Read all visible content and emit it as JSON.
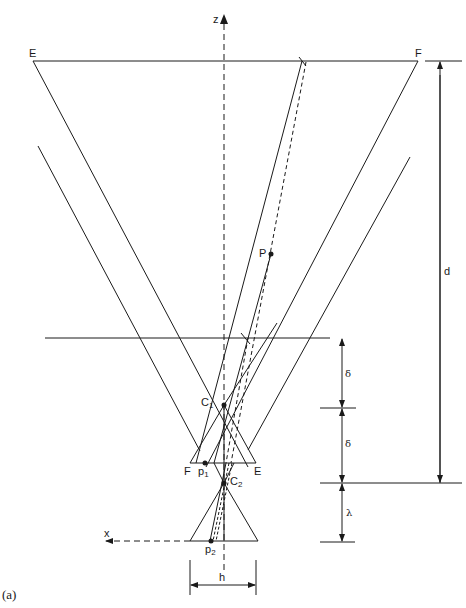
{
  "figure": {
    "caption": "(a)",
    "axes": {
      "z_label": "z",
      "x_label": "x"
    },
    "points": {
      "E_top": "E",
      "F_top": "F",
      "P": "P",
      "C1": {
        "base": "C",
        "sub": "1"
      },
      "C2": {
        "base": "C",
        "sub": "2"
      },
      "p1": {
        "base": "p",
        "sub": "1"
      },
      "p2": {
        "base": "p",
        "sub": "2"
      },
      "F_lower": "F",
      "E_lower": "E"
    },
    "dimensions": {
      "d": "d",
      "delta_upper": "δ",
      "delta_lower": "δ",
      "lambda": "λ",
      "h": "h"
    },
    "colors": {
      "line": "#1a1a1a",
      "background": "#ffffff"
    }
  }
}
